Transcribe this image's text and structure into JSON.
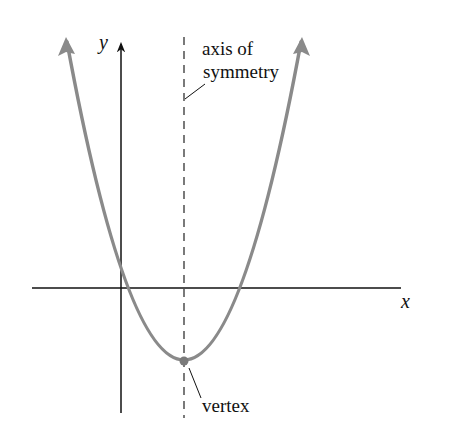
{
  "diagram": {
    "type": "parabola-graph",
    "axes": {
      "x_label": "x",
      "y_label": "y",
      "axis_color": "#111111"
    },
    "curve": {
      "kind": "upward-opening parabola",
      "color": "#8a8a8a"
    },
    "annotations": {
      "axis_of_symmetry_line1": "axis of",
      "axis_of_symmetry_line2": "symmetry",
      "vertex": "vertex"
    }
  }
}
